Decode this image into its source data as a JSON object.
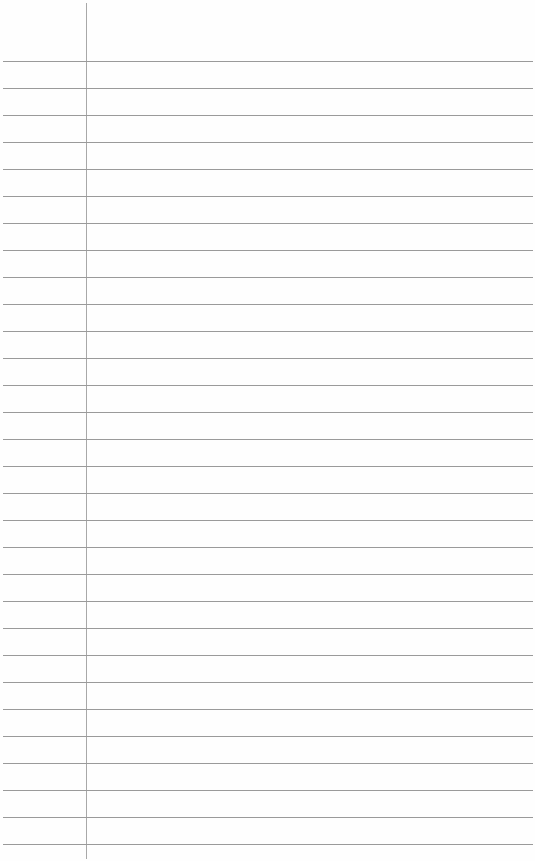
{
  "paper": {
    "type": "lined-paper",
    "margin_line_x": 86,
    "first_rule_y": 61,
    "rule_spacing": 27,
    "rule_count": 30,
    "rule_color": "#9a9a9a",
    "margin_color": "#a8a8a8",
    "background": "#fefefe"
  }
}
